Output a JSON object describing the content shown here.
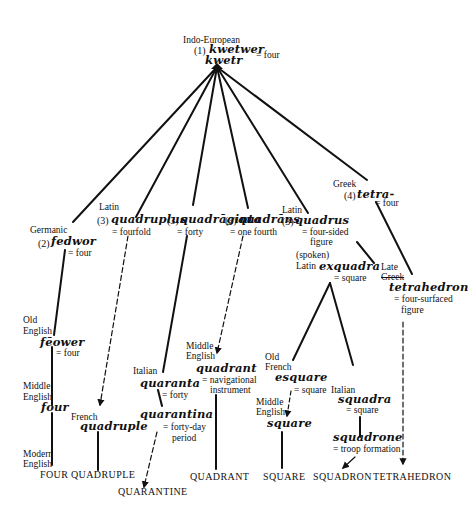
{
  "diagram": {
    "type": "etymology-tree",
    "root": {
      "language": "Indo-European",
      "number": "(1)",
      "word_line1": "kwetwer",
      "word_line2": "kwetr",
      "gloss": "= four"
    },
    "branches": {
      "germanic": {
        "language": "Germanic",
        "number": "(2)",
        "word": "fedwor",
        "gloss": "= four",
        "old_english": {
          "language_line1": "Old",
          "language_line2": "English",
          "word": "fēower",
          "gloss": "= four"
        },
        "middle_english": {
          "language_line1": "Middle",
          "language_line2": "English",
          "word": "four"
        },
        "modern_english": {
          "language_line1": "Modern",
          "language_line2": "English",
          "result": "FOUR"
        }
      },
      "quadruplus": {
        "language": "Latin",
        "number": "(3)",
        "word": "quadruplus",
        "gloss": "= fourfold",
        "french": {
          "language": "French",
          "word": "quadruple"
        },
        "result": "QUADRUPLE"
      },
      "quadraginta": {
        "number": "(3)",
        "word": "quadrāginta",
        "gloss": "= forty",
        "italian": {
          "language": "Italian",
          "word": "quaranta",
          "gloss": "= forty"
        },
        "quarantina": {
          "word": "quarantina",
          "gloss_line1": "= forty-day",
          "gloss_line2": "period"
        },
        "result": "QUARANTINE"
      },
      "quadrans": {
        "number": "(3)",
        "word": "quadrāns",
        "gloss": "= one fourth",
        "middle_english": {
          "language_line1": "Middle",
          "language_line2": "English",
          "word": "quadrant",
          "gloss_line1": "= navigational",
          "gloss_line2": "instrument"
        },
        "result": "QUADRANT"
      },
      "quadrus": {
        "language": "Latin",
        "number": "(3)",
        "word": "quadrus",
        "gloss_line1": "= four-sided",
        "gloss_line2": "figure",
        "spoken_latin": {
          "language_line1": "(spoken)",
          "language_line2": "Latin",
          "word": "exquadra",
          "gloss": "= square"
        },
        "old_french": {
          "language_line1": "Old",
          "language_line2": "French",
          "word": "esquare",
          "gloss": "= square"
        },
        "middle_english": {
          "language_line1": "Middle",
          "language_line2": "English",
          "word": "square"
        },
        "result_square": "SQUARE",
        "italian": {
          "language": "Italian",
          "word": "squadra",
          "gloss": "= square"
        },
        "squadrone": {
          "word": "squadrone",
          "gloss": "= troop formation"
        },
        "result_squadron": "SQUADRON"
      },
      "greek": {
        "language": "Greek",
        "number": "(4)",
        "word": "tetra-",
        "gloss": "= four",
        "late_greek": {
          "language_line1": "Late",
          "language_line2": "Greek",
          "word": "tetrahedron",
          "gloss_line1": "= four-surfaced",
          "gloss_line2": "figure"
        },
        "result": "TETRAHEDRON"
      }
    },
    "line_color": "#111111",
    "legend": {
      "solid_line": "direct descent",
      "dashed_arrow": "borrowing"
    }
  }
}
